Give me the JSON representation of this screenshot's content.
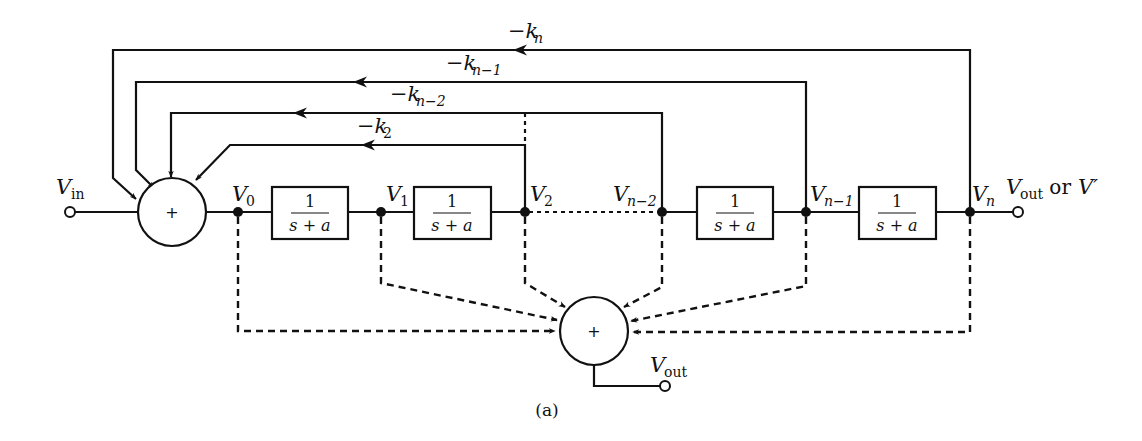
{
  "diagram": {
    "caption": "(a)",
    "input": {
      "label": "V",
      "sub": "in"
    },
    "output_main": {
      "label": "V",
      "sub": "out",
      "suffix": " or ",
      "alt": "V′"
    },
    "output_sum": {
      "label": "V",
      "sub": "out"
    },
    "summer_symbol": "+",
    "block": {
      "numerator": "1",
      "denominator": "s + a"
    },
    "nodes": [
      {
        "label": "V",
        "sub": "0"
      },
      {
        "label": "V",
        "sub": "1"
      },
      {
        "label": "V",
        "sub": "2"
      },
      {
        "label": "V",
        "sub": "n−2"
      },
      {
        "label": "V",
        "sub": "n−1"
      },
      {
        "label": "V",
        "sub": "n"
      }
    ],
    "feedback_gains": [
      {
        "label": "−k",
        "sub": "n"
      },
      {
        "label": "−k",
        "sub": "n−1"
      },
      {
        "label": "−k",
        "sub": "n−2"
      },
      {
        "label": "−k",
        "sub": "2"
      }
    ]
  }
}
